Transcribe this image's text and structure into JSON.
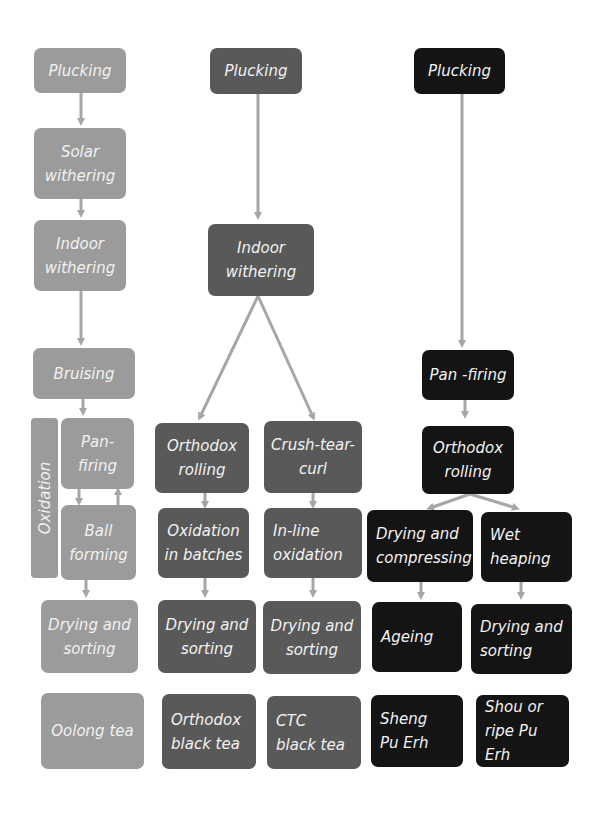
{
  "diagram": {
    "title": "",
    "colors": {
      "oolong": "#9b9b9b",
      "black": "#595959",
      "puerh": "#141414",
      "arrow": "#a6a6a6",
      "text": "#f2f2f2"
    },
    "oolong": {
      "plucking": "Plucking",
      "solar_withering": "Solar\nwithering",
      "indoor_withering": "Indoor\nwithering",
      "bruising": "Bruising",
      "oxidation_label": "Oxidation",
      "pan_firing": "Pan-\nfiring",
      "ball_forming": "Ball\nforming",
      "drying_sorting": "Drying and\nsorting",
      "product": "Oolong tea"
    },
    "black": {
      "plucking": "Plucking",
      "indoor_withering": "Indoor\nwithering",
      "orthodox_rolling": "Orthodox\nrolling",
      "ctc": "Crush-tear-\ncurl",
      "oxidation_batches": "Oxidation\nin batches",
      "inline_oxidation": "In-line\noxidation",
      "drying_sorting_orthodox": "Drying and\nsorting",
      "drying_sorting_ctc": "Drying and\nsorting",
      "product_orthodox": "Orthodox\nblack tea",
      "product_ctc": "CTC\nblack tea"
    },
    "puerh": {
      "plucking": "Plucking",
      "pan_firing": "Pan -firing",
      "orthodox_rolling": "Orthodox\nrolling",
      "drying_compressing": "Drying and\ncompressing",
      "wet_heaping": "Wet\nheaping",
      "ageing": "Ageing",
      "drying_sorting": "Drying and\nsorting",
      "product_sheng": "Sheng\nPu Erh",
      "product_shou": "Shou or\nripe Pu Erh"
    }
  }
}
